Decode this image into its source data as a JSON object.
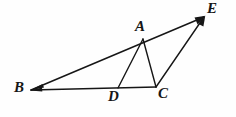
{
  "figure": {
    "canvas": {
      "width": 236,
      "height": 117
    },
    "background_color": "#fefefe",
    "ink_color": "#161616",
    "vertices": [
      {
        "id": "A",
        "label": "A",
        "x": 143,
        "y": 39,
        "label_x": 135,
        "label_y": 19
      },
      {
        "id": "B",
        "label": "B",
        "x": 31,
        "y": 90,
        "label_x": 14,
        "label_y": 80
      },
      {
        "id": "C",
        "label": "C",
        "x": 156,
        "y": 87,
        "label_x": 158,
        "label_y": 86
      },
      {
        "id": "D",
        "label": "D",
        "x": 118,
        "y": 88,
        "label_x": 108,
        "label_y": 89
      },
      {
        "id": "E",
        "label": "E",
        "x": 204,
        "y": 17,
        "label_x": 207,
        "label_y": 1
      }
    ],
    "segments": [
      {
        "id": "BE",
        "from": "B",
        "to": "E",
        "x1": 31,
        "y1": 90,
        "x2": 204,
        "y2": 17,
        "width": 1.5,
        "arrow_start": true,
        "arrow_end": true
      },
      {
        "id": "BC",
        "from": "B",
        "to": "C",
        "x1": 31,
        "y1": 90,
        "x2": 156,
        "y2": 87,
        "width": 1.6,
        "arrow_start": true,
        "arrow_end": false
      },
      {
        "id": "AD",
        "from": "A",
        "to": "D",
        "x1": 143,
        "y1": 39,
        "x2": 118,
        "y2": 88,
        "width": 1.4,
        "arrow_start": false,
        "arrow_end": false
      },
      {
        "id": "AC",
        "from": "A",
        "to": "C",
        "x1": 143,
        "y1": 39,
        "x2": 156,
        "y2": 87,
        "width": 1.4,
        "arrow_start": false,
        "arrow_end": false
      },
      {
        "id": "CE",
        "from": "C",
        "to": "E",
        "x1": 156,
        "y1": 87,
        "x2": 204,
        "y2": 17,
        "width": 1.4,
        "arrow_start": false,
        "arrow_end": true
      }
    ],
    "label_font_size": "15px"
  }
}
